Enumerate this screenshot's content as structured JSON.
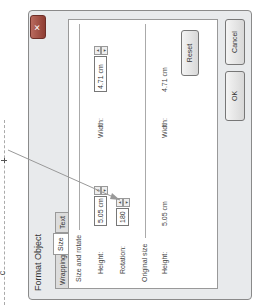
{
  "dialog": {
    "title": "Format Object",
    "close_label": "✕",
    "tabs": [
      {
        "label": "Wrapping",
        "active": false
      },
      {
        "label": "Size",
        "active": true
      },
      {
        "label": "Text Box",
        "active": false
      }
    ],
    "size_and_rotate": {
      "section_label": "Size and rotate",
      "height_label": "Height:",
      "height_value": "5.05 cm",
      "width_label": "Width:",
      "width_value": "4.71 cm",
      "rotation_label": "Rotation:",
      "rotation_value": "180"
    },
    "original_size": {
      "section_label": "Original size",
      "height_label": "Height:",
      "height_value": "5.05 cm",
      "width_label": "Width:",
      "width_value": "4.71 cm"
    },
    "buttons": {
      "reset": "Reset",
      "ok": "OK",
      "cancel": "Cancel"
    }
  },
  "spinner_icons": {
    "up": "▲",
    "down": "▼"
  },
  "annotation": {
    "fragment": "c"
  }
}
